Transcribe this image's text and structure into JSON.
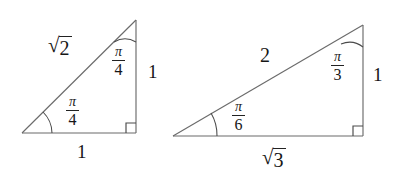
{
  "figure": {
    "background_color": "#ffffff",
    "stroke_color": "#6b6b6b",
    "text_color": "#161616",
    "triangles": [
      {
        "id": "triangle-45-45-90",
        "name": "isosceles-right-triangle",
        "vertices": {
          "left": [
            22,
            133
          ],
          "right_angle": [
            136,
            133
          ],
          "apex": [
            136,
            20
          ]
        },
        "labels": {
          "hypotenuse": {
            "type": "radical",
            "surd": "√",
            "radicand": "2",
            "text": "√2",
            "x": 48,
            "y": 36
          },
          "vertical_side": {
            "type": "number",
            "text": "1",
            "x": 148,
            "y": 62
          },
          "base_side": {
            "type": "number",
            "text": "1",
            "x": 77,
            "y": 142
          },
          "apex_angle": {
            "type": "fraction",
            "numerator": "π",
            "denominator": "4",
            "text": "π/4",
            "x": 112,
            "y": 45
          },
          "base_angle": {
            "type": "fraction",
            "numerator": "π",
            "denominator": "4",
            "text": "π/4",
            "x": 66,
            "y": 95
          }
        },
        "right_angle_marker": {
          "x": 136,
          "y": 133,
          "size": 10
        },
        "arcs": [
          {
            "name": "apex-angle-arc",
            "vertex": "apex",
            "radius": 22
          },
          {
            "name": "base-angle-arc",
            "vertex": "left",
            "radius": 30
          }
        ]
      },
      {
        "id": "triangle-30-60-90",
        "name": "half-equilateral-right-triangle",
        "vertices": {
          "left": [
            173,
            136
          ],
          "right_angle": [
            363,
            136
          ],
          "apex": [
            363,
            25
          ]
        },
        "labels": {
          "hypotenuse": {
            "type": "number",
            "text": "2",
            "x": 260,
            "y": 45
          },
          "vertical_side": {
            "type": "number",
            "text": "1",
            "x": 373,
            "y": 65
          },
          "base_side": {
            "type": "radical",
            "surd": "√",
            "radicand": "3",
            "text": "√3",
            "x": 262,
            "y": 148
          },
          "apex_angle": {
            "type": "fraction",
            "numerator": "π",
            "denominator": "3",
            "text": "π/3",
            "x": 331,
            "y": 50
          },
          "base_angle": {
            "type": "fraction",
            "numerator": "π",
            "denominator": "6",
            "text": "π/6",
            "x": 232,
            "y": 100
          }
        },
        "right_angle_marker": {
          "x": 363,
          "y": 136,
          "size": 10
        },
        "arcs": [
          {
            "name": "apex-angle-arc",
            "vertex": "apex",
            "radius": 22
          },
          {
            "name": "base-angle-arc",
            "vertex": "left",
            "radius": 44
          }
        ]
      }
    ]
  }
}
